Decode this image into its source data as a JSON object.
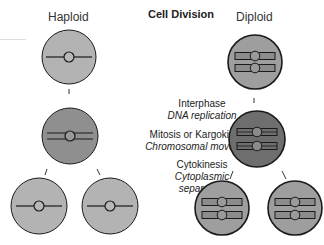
{
  "diagram": {
    "title": "Cell Division",
    "columns": {
      "left": "Haploid",
      "right": "Diploid"
    },
    "stages": [
      {
        "name": "Interphase",
        "detail": "DNA replication"
      },
      {
        "name": "Mitosis or Kargokinesis",
        "detail": "Chromosomal movement"
      },
      {
        "name": "Cytokinesis",
        "detail": "Cytoplasmic separation",
        "detail_lines": [
          "Cytoplasmic",
          "separation"
        ]
      }
    ],
    "colors": {
      "cell_light": "#b3b3b3",
      "cell_medium": "#8f8f8f",
      "cell_dark": "#6e6e6e",
      "outline": "#1a1a1a"
    }
  }
}
